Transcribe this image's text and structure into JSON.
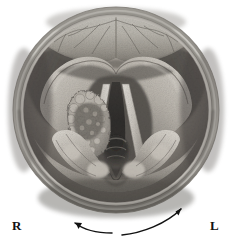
{
  "figure": {
    "type": "medical-illustration",
    "view_shape": "circle",
    "rendering": "grayscale-halftone-engraving"
  },
  "labels": {
    "right_label": "R",
    "left_label": "L"
  },
  "arrows": {
    "left_arrow": {
      "name": "left-curved-arrow",
      "direction": "points-left-outward",
      "head_at": "upper-left-end"
    },
    "right_arrow": {
      "name": "right-curved-arrow",
      "direction": "points-right-outward",
      "head_at": "upper-right-end"
    }
  },
  "anatomy": {
    "parts": [
      {
        "name": "epiglottis",
        "position": "top"
      },
      {
        "name": "aryepiglottic-fold-right",
        "position": "upper-left"
      },
      {
        "name": "aryepiglottic-fold-left",
        "position": "upper-right"
      },
      {
        "name": "ventricular-band-right",
        "position": "mid-left"
      },
      {
        "name": "ventricular-band-left",
        "position": "mid-right"
      },
      {
        "name": "vocal-cord-right",
        "position": "center-left"
      },
      {
        "name": "vocal-cord-left",
        "position": "center-right"
      },
      {
        "name": "papillomatous-mass",
        "position": "on-right-vocal-cord"
      },
      {
        "name": "glottic-airway",
        "position": "center"
      },
      {
        "name": "trachea",
        "position": "center-lower"
      },
      {
        "name": "arytenoid-right",
        "position": "lower-left"
      },
      {
        "name": "arytenoid-left",
        "position": "lower-right"
      },
      {
        "name": "pyriform-sinus-right",
        "position": "left"
      },
      {
        "name": "pyriform-sinus-left",
        "position": "right"
      },
      {
        "name": "posterior-commissure",
        "position": "bottom-center"
      }
    ]
  },
  "geometry": {
    "circle_center_x": 116,
    "circle_center_y": 110,
    "circle_radius": 104
  },
  "colors": {
    "background": "#ffffff",
    "ink": "#111111",
    "rim_light": "#d8d6d2",
    "rim_mid": "#a5a29c",
    "rim_dark": "#5d5a56",
    "tissue_light": "#ded9d2",
    "tissue_mid": "#9d978f",
    "tissue_shadow": "#4e4b47",
    "cavity_dark": "#2b2927",
    "airway_black": "#0d0c0c"
  }
}
